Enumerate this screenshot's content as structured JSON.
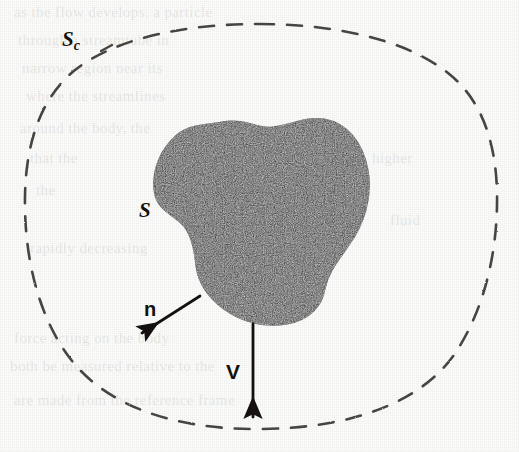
{
  "figure": {
    "kind": "control-volume-diagram",
    "caption_text": "",
    "background_color": "#fdfdfc",
    "ink_color": "#15110e",
    "blob_fill_color": "#1d1a17",
    "dashed_stroke_color": "#4a4743"
  },
  "labels": {
    "control_surface": {
      "symbol": "S",
      "subscript": "c",
      "meaning": "control-surface"
    },
    "body_surface": {
      "symbol": "S",
      "meaning": "body-surface"
    },
    "normal_vector": {
      "symbol": "n",
      "meaning": "outward-unit-normal"
    },
    "velocity_vector": {
      "symbol": "V",
      "meaning": "velocity"
    }
  },
  "bleed_through_text": {
    "lines": [
      "as the flow develops. a particle",
      "through a streamtube in",
      "narrow region near its",
      "where the streamlines",
      "around the body, the",
      "that the",
      "higher",
      "the",
      "fluid",
      "rapidly decreasing",
      "force acting on the body",
      "both be measured relative to the",
      "are made from the reference frame"
    ]
  },
  "geometry": {
    "canvas": {
      "width": 519,
      "height": 452
    },
    "dashed_outline_label_anchor": {
      "x": 62,
      "y": 29
    },
    "normal_arrow": {
      "x1": 200,
      "y1": 296,
      "x2": 139,
      "y2": 334
    },
    "velocity_arrow": {
      "x1": 253,
      "y1": 323,
      "x2": 253,
      "y2": 419
    }
  }
}
